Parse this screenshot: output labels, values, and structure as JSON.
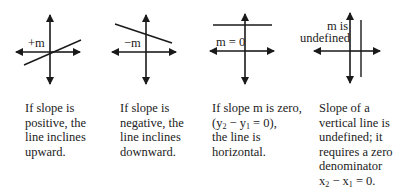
{
  "panels": [
    {
      "id": "positive",
      "label": "+m",
      "caption_lines": [
        "If slope is",
        "positive, the",
        "line inclines",
        "upward."
      ]
    },
    {
      "id": "negative",
      "label": "−m",
      "caption_lines": [
        "If slope is",
        "negative, the",
        "line inclines",
        "downward."
      ]
    },
    {
      "id": "zero",
      "label": "m = 0",
      "caption_lines": [
        "If slope m is zero,",
        "(y2 − y1 = 0),",
        "the line is",
        "horizontal."
      ]
    },
    {
      "id": "undefined",
      "label_lines": [
        "m is",
        "undefined"
      ],
      "caption_lines": [
        "Slope of a",
        "vertical line is",
        "undefined; it",
        "requires a zero",
        "denominator",
        "x2 − x1 = 0."
      ]
    }
  ],
  "colors": {
    "line": "#1a1a1a",
    "text": "#222222",
    "background": "#ffffff"
  }
}
